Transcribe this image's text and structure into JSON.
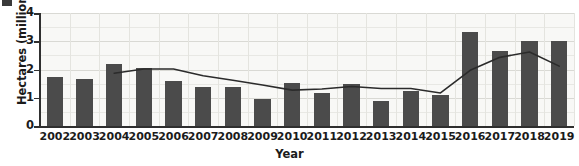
{
  "chart_data": {
    "type": "bar",
    "title": "",
    "xlabel": "Year",
    "ylabel": "Hectares (millions)",
    "categories": [
      "2002",
      "2003",
      "2004",
      "2005",
      "2006",
      "2007",
      "2008",
      "2009",
      "2010",
      "2011",
      "2012",
      "2013",
      "2014",
      "2015",
      "2016",
      "2017",
      "2018",
      "2019"
    ],
    "values": [
      1.74,
      1.68,
      2.19,
      2.06,
      1.6,
      1.38,
      1.38,
      0.96,
      1.53,
      1.18,
      1.48,
      0.88,
      1.24,
      1.1,
      3.33,
      2.66,
      3.02,
      3.0
    ],
    "series": [
      {
        "name": "bars",
        "type": "bar",
        "values": [
          1.74,
          1.68,
          2.19,
          2.06,
          1.6,
          1.38,
          1.38,
          0.96,
          1.53,
          1.18,
          1.48,
          0.88,
          1.24,
          1.1,
          3.33,
          2.66,
          3.02,
          3.0
        ]
      },
      {
        "name": "trend-line",
        "type": "line",
        "x": [
          "2004",
          "2005",
          "2006",
          "2007",
          "2008",
          "2009",
          "2010",
          "2011",
          "2012",
          "2013",
          "2014",
          "2015",
          "2016",
          "2017",
          "2018",
          "2019"
        ],
        "values": [
          1.87,
          2.02,
          2.02,
          1.78,
          1.62,
          1.45,
          1.27,
          1.31,
          1.4,
          1.33,
          1.33,
          1.17,
          1.97,
          2.43,
          2.62,
          2.12
        ]
      }
    ],
    "ylim": [
      0,
      4
    ],
    "yticks": [
      0,
      1,
      2,
      3,
      4
    ],
    "ytick_labels": [
      "0",
      "1",
      "2",
      "3",
      "4"
    ],
    "grid": true,
    "grid_minor_step": 0.5,
    "legend": "none",
    "bar_color": "#4b4b4b",
    "line_color": "#2b2b2b",
    "plot_background": "#f8f8f6",
    "gridline_color": "#d9d9d4",
    "axis_color": "#2f2f2f"
  }
}
